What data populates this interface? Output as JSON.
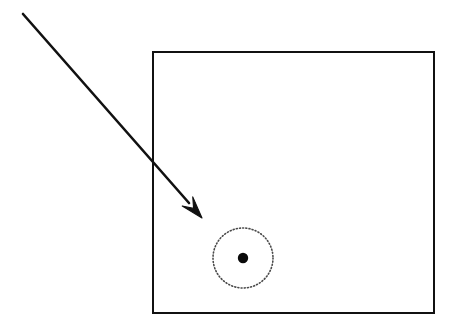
{
  "canvas": {
    "width": 454,
    "height": 325,
    "background_color": "#ffffff"
  },
  "figure": {
    "type": "schematic-diagram",
    "stroke_color": "#111111",
    "dotted_color": "#555555"
  },
  "shapes": {
    "boundary_rectangle": {
      "name": "boundary-rectangle",
      "x": 153,
      "y": 52,
      "width": 281,
      "height": 261,
      "stroke_width": 2.6,
      "stroke_color": "#111111",
      "fill": "none"
    },
    "dotted_circle": {
      "name": "dotted-circle",
      "cx": 243,
      "cy": 258,
      "r": 30,
      "stroke_width": 1.6,
      "stroke_color": "#4a4a4a",
      "dash_pattern": "1 2.2",
      "fill": "none"
    },
    "center_dot": {
      "name": "center-dot",
      "cx": 243,
      "cy": 258,
      "r": 5.2,
      "fill": "#0a0a0a"
    },
    "arrow": {
      "name": "incoming-arrow",
      "tail_x": 23,
      "tail_y": 14,
      "tip_x": 202,
      "tip_y": 218,
      "shaft_end_x": 189,
      "shaft_end_y": 203,
      "stroke_width": 2.6,
      "stroke_color": "#111111",
      "head_length": 22,
      "head_width": 14
    }
  }
}
